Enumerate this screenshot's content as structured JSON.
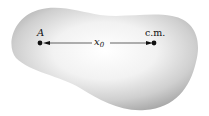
{
  "figure": {
    "colors": {
      "body_light": "#ffffff",
      "body_mid": "#d6d6d6",
      "body_dark": "#a8a8a8",
      "ink": "#111111"
    },
    "point_a": {
      "label": "A"
    },
    "center_of_mass": {
      "label": "c.m."
    },
    "distance": {
      "symbol": "x",
      "subscript": "0"
    }
  }
}
